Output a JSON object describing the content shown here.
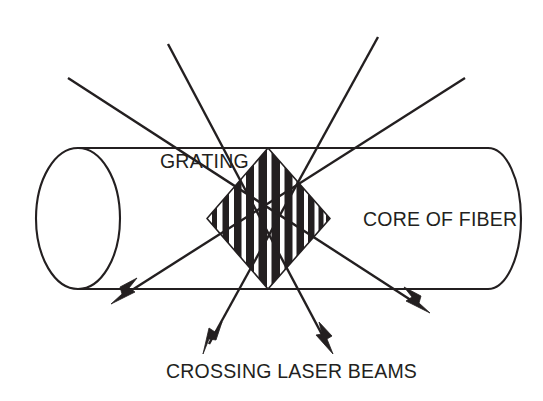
{
  "figure": {
    "background_color": "#ffffff",
    "ink_color": "#231f20",
    "width": 543,
    "height": 401
  },
  "labels": {
    "grating": "GRATING",
    "core_of_fiber": "CORE OF FIBER",
    "crossing_laser_beams": "CROSSING LASER BEAMS"
  },
  "label_positions": {
    "grating": {
      "x": 160,
      "y": 168
    },
    "core_of_fiber": {
      "x": 363,
      "y": 226
    },
    "crossing_laser_beams": {
      "x": 166,
      "y": 378
    }
  },
  "fiber": {
    "name": "core-of-fiber-cylinder",
    "top_edge_y": 148,
    "bottom_edge_y": 289,
    "body_left_x": 78,
    "body_right_x": 488,
    "left_cap": {
      "cx": 78,
      "cy": 218.5,
      "rx": 42,
      "ry": 70.5
    },
    "right_cap": {
      "cx": 488,
      "cy": 218.5,
      "rx": 33,
      "ry": 70.5
    }
  },
  "grating": {
    "name": "bragg-grating-diamond",
    "left_tip": {
      "x": 207,
      "y": 218.5
    },
    "top_vertex": {
      "x": 268,
      "y": 148
    },
    "right_tip": {
      "x": 330,
      "y": 218.5
    },
    "bottom_vertex": {
      "x": 268,
      "y": 289
    },
    "stripe_count": 11,
    "stripe_fill": "#231f20",
    "stripes": [
      {
        "x": 212.0,
        "w": 5.0
      },
      {
        "x": 222.5,
        "w": 6.5
      },
      {
        "x": 234.0,
        "w": 7.5
      },
      {
        "x": 246.0,
        "w": 8.0
      },
      {
        "x": 258.5,
        "w": 8.5
      },
      {
        "x": 271.5,
        "w": 8.5
      },
      {
        "x": 284.5,
        "w": 8.0
      },
      {
        "x": 296.5,
        "w": 7.5
      },
      {
        "x": 308.0,
        "w": 6.5
      },
      {
        "x": 318.5,
        "w": 5.0
      },
      {
        "x": 326.0,
        "w": 3.0
      }
    ]
  },
  "beams": {
    "name": "crossing-laser-beams",
    "top_node": {
      "x": 268,
      "y": 148
    },
    "bottom_node": {
      "x": 268,
      "y": 289
    },
    "items": [
      {
        "id": "beam-upper-left-to-lower-right",
        "start": {
          "x": 68,
          "y": 78
        },
        "end": {
          "x": 428,
          "y": 312
        },
        "passes_through": "top_node",
        "arrow_at": "end",
        "arrow_angle_deg": 33
      },
      {
        "id": "beam-top-left-to-bottom-right",
        "start": {
          "x": 168,
          "y": 44
        },
        "end": {
          "x": 332,
          "y": 352
        },
        "passes_through": "top_node",
        "arrow_at": "end",
        "arrow_angle_deg": 62
      },
      {
        "id": "beam-upper-right-to-lower-left",
        "start": {
          "x": 465,
          "y": 78
        },
        "end": {
          "x": 113,
          "y": 303
        },
        "passes_through": "top_node",
        "arrow_at": "end",
        "arrow_angle_deg": 147
      },
      {
        "id": "beam-top-right-to-bottom-left",
        "start": {
          "x": 378,
          "y": 37
        },
        "end": {
          "x": 204,
          "y": 352
        },
        "passes_through": "top_node",
        "arrow_at": "end",
        "arrow_angle_deg": 119
      }
    ],
    "arrow_count": 4
  }
}
